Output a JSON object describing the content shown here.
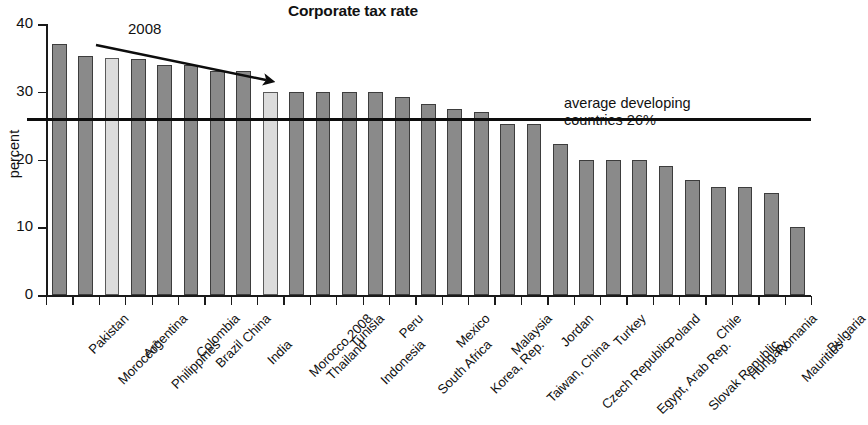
{
  "chart_data": {
    "type": "bar",
    "title": "Corporate tax rate",
    "xlabel": "",
    "ylabel": "percent",
    "ylim": [
      0,
      40
    ],
    "yticks": [
      0,
      10,
      20,
      30,
      40
    ],
    "grid": false,
    "legend": "none",
    "categories": [
      "Pakistan",
      "Moroccoᵃ",
      "Argentina",
      "Philippines",
      "Colombia",
      "Brazil",
      "China",
      "India",
      "Morocco 2008",
      "Thailand",
      "Tunisia",
      "Indonesia",
      "Peru",
      "South Africa",
      "Mexico",
      "Korea, Rep.",
      "Malaysia",
      "Taiwan, China",
      "Jordan",
      "Czech Republic",
      "Turkey",
      "Egypt, Arab Rep.",
      "Poland",
      "Slovak Republic",
      "Chile",
      "Hungary",
      "Romania",
      "Mauritius",
      "Bulgaria"
    ],
    "values": [
      37,
      35.3,
      35,
      34.8,
      34,
      34,
      33,
      33,
      30,
      30,
      30,
      30,
      30,
      29.2,
      28.2,
      27.5,
      27,
      25.2,
      25.2,
      22.3,
      20,
      20,
      20,
      19,
      17,
      16,
      16,
      15,
      10
    ],
    "highlighted": [
      "Argentina",
      "Morocco 2008"
    ],
    "annotations": [
      {
        "id": "trend-2008",
        "label": "2008",
        "type": "arrow",
        "description": "declining trend arrow spanning Morocco through India"
      },
      {
        "id": "average-line",
        "label_line1": "average developing",
        "label_line2": "countries 26%",
        "type": "hline",
        "value": 26
      }
    ],
    "colors": {
      "bar_fill": "#8a8a8a",
      "bar_fill_highlight": "#dcdcdc",
      "bar_stroke": "#3d3d3d",
      "axis": "#1a1a1a",
      "average_line": "#0d0d0d",
      "text": "#111111",
      "background": "#ffffff"
    }
  }
}
